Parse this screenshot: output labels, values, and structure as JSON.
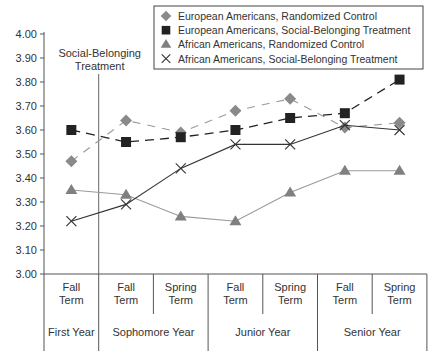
{
  "chart_data": {
    "type": "line",
    "title": "",
    "xlabel": "",
    "ylabel": "",
    "ylim": [
      3.0,
      4.0
    ],
    "yticks": [
      "3.00",
      "3.10",
      "3.20",
      "3.30",
      "3.40",
      "3.50",
      "3.60",
      "3.70",
      "3.80",
      "3.90",
      "4.00"
    ],
    "categories": [
      {
        "term": "Fall Term",
        "year": "First Year"
      },
      {
        "term": "Fall Term",
        "year": "Sophomore Year"
      },
      {
        "term": "Spring Term",
        "year": "Sophomore Year"
      },
      {
        "term": "Fall Term",
        "year": "Junior Year"
      },
      {
        "term": "Spring Term",
        "year": "Junior Year"
      },
      {
        "term": "Fall Term",
        "year": "Senior Year"
      },
      {
        "term": "Spring Term",
        "year": "Senior Year"
      }
    ],
    "year_groups": [
      {
        "label": "First Year",
        "span": 1
      },
      {
        "label": "Sophomore Year",
        "span": 2
      },
      {
        "label": "Junior Year",
        "span": 2
      },
      {
        "label": "Senior Year",
        "span": 2
      }
    ],
    "annotation": {
      "line1": "Social-Belonging",
      "line2": "Treatment",
      "position_between": [
        0,
        1
      ]
    },
    "legend_position": "top-right",
    "grid": false,
    "series": [
      {
        "name": "European Americans, Randomized Control",
        "marker": "diamond",
        "line": "dashed",
        "color": "#8a8a8a",
        "values": [
          3.47,
          3.64,
          3.59,
          3.68,
          3.73,
          3.61,
          3.63
        ]
      },
      {
        "name": "European Americans, Social-Belonging Treatment",
        "marker": "square",
        "line": "dashed",
        "color": "#222222",
        "values": [
          3.6,
          3.55,
          3.57,
          3.6,
          3.65,
          3.67,
          3.81
        ]
      },
      {
        "name": "African Americans, Randomized Control",
        "marker": "triangle",
        "line": "solid",
        "color": "#8a8a8a",
        "values": [
          3.35,
          3.33,
          3.24,
          3.22,
          3.34,
          3.43,
          3.43
        ]
      },
      {
        "name": "African Americans, Social-Belonging Treatment",
        "marker": "x",
        "line": "solid",
        "color": "#333333",
        "values": [
          3.22,
          3.29,
          3.44,
          3.54,
          3.54,
          3.62,
          3.6
        ]
      }
    ]
  }
}
